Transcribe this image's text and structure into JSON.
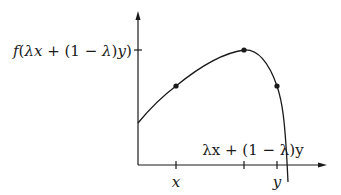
{
  "diagram": {
    "type": "concave function illustration",
    "colors": {
      "stroke": "#1a1a1a",
      "background": "#ffffff"
    },
    "y_axis": {
      "tick_label": "f(λx + (1 − λ)y)",
      "tick_label_parts": {
        "f": "f",
        "open": "(",
        "lambda": "λ",
        "x": "x",
        "plus": " + ",
        "paren1": "(1 − ",
        "lambda2": "λ",
        "close1": ")",
        "y": "y",
        "close2": ")"
      }
    },
    "x_axis": {
      "ticks": [
        {
          "label": "x",
          "position": "below"
        },
        {
          "label": "λx + (1 − λ)y",
          "position": "above"
        },
        {
          "label": "y",
          "position": "below"
        }
      ]
    },
    "points": [
      {
        "name": "f(x)"
      },
      {
        "name": "f(λx + (1 − λ)y)"
      },
      {
        "name": "f(y)"
      }
    ]
  }
}
